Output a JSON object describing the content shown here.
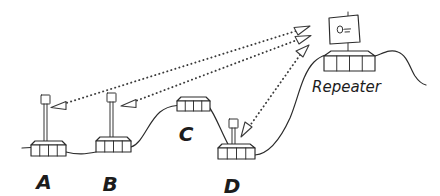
{
  "diagram": {
    "line_color": "#2b2b2b",
    "beam_color": "#3a3a3a",
    "background": "#ffffff",
    "nodes": [
      {
        "id": "A",
        "label": "A",
        "kind": "base-station-with-mast",
        "has_mast": true,
        "segments": 4,
        "label_x": 44,
        "label_y": 189
      },
      {
        "id": "B",
        "label": "B",
        "kind": "base-station-with-mast",
        "has_mast": true,
        "segments": 4,
        "label_x": 110,
        "label_y": 191
      },
      {
        "id": "C",
        "label": "C",
        "kind": "base-station",
        "has_mast": false,
        "segments": 4,
        "label_x": 186,
        "label_y": 141
      },
      {
        "id": "D",
        "label": "D",
        "kind": "base-station-with-mast",
        "has_mast": true,
        "segments": 4,
        "label_x": 232,
        "label_y": 193
      },
      {
        "id": "Repeater",
        "label": "Repeater",
        "kind": "repeater-with-panel-antenna",
        "has_mast": true,
        "segments": 4,
        "label_x": 312,
        "label_y": 92
      }
    ],
    "links": [
      {
        "from": "A",
        "to": "Repeater",
        "type": "wireless",
        "bidirectional": true
      },
      {
        "from": "B",
        "to": "Repeater",
        "type": "wireless",
        "bidirectional": true
      },
      {
        "from": "D",
        "to": "Repeater",
        "type": "wireless",
        "bidirectional": true
      },
      {
        "from": "A",
        "to": "B",
        "type": "cable",
        "bidirectional": false
      },
      {
        "from": "B",
        "to": "C",
        "type": "cable",
        "bidirectional": false
      },
      {
        "from": "C",
        "to": "D",
        "type": "cable",
        "bidirectional": false
      },
      {
        "from": "D",
        "to": "Repeater",
        "type": "cable",
        "bidirectional": false
      }
    ]
  }
}
